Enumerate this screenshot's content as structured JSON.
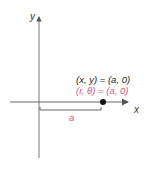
{
  "diagram": {
    "axes": {
      "x_label": "x",
      "y_label": "y"
    },
    "point": {
      "cartesian": "(x, y) = (a, 0)",
      "polar": "(r, θ) = (a, 0)"
    },
    "distance_label": "a",
    "colors": {
      "axis": "#555555",
      "point": "#111111",
      "cartesian_text": "#222222",
      "polar_text": "#d4577f"
    }
  }
}
